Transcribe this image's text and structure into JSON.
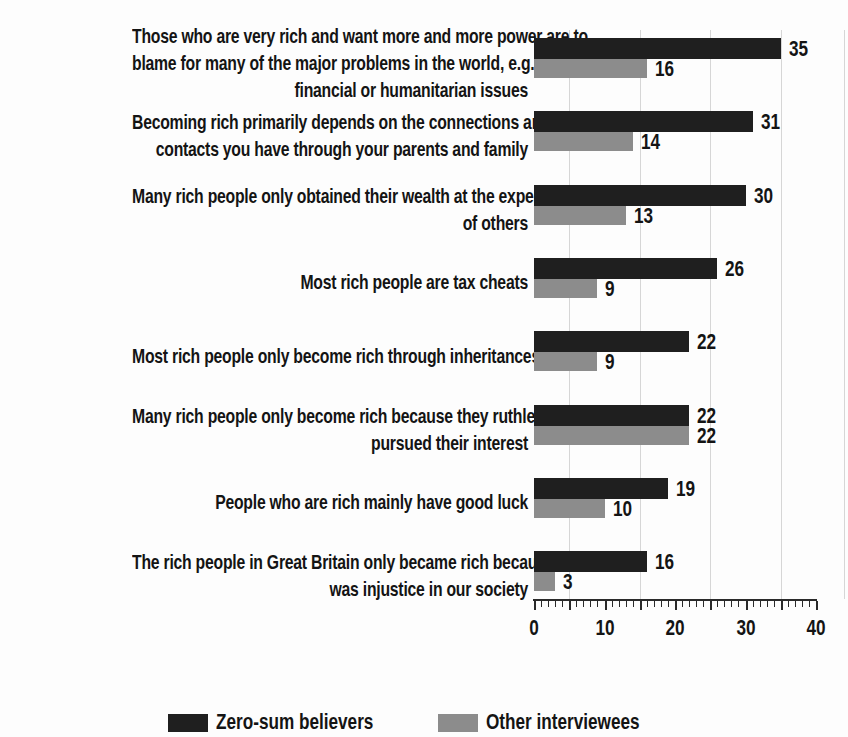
{
  "chart_data": {
    "type": "bar",
    "orientation": "horizontal",
    "title": "",
    "xlabel": "",
    "ylabel": "",
    "xlim": [
      0,
      40
    ],
    "x_tick_labels": [
      "0",
      "10",
      "20",
      "30",
      "40"
    ],
    "minor_tick_step": 1,
    "major_tick_step": 5,
    "gridlines_at_units": [
      5,
      15,
      25,
      35,
      44
    ],
    "grid_color": "#d6d6d6",
    "axis_color": "#2a2a2a",
    "text_color": "#141414",
    "legend_position": "bottom",
    "categories": [
      {
        "label": "Those who are very rich and want more and more power are to blame for many of the major problems in the world, e.g., financial or humanitarian issues",
        "label_lines": [
          "Those who are very rich and want more and more power are to",
          "blame for many of the major problems in the world, e.g.,",
          "financial or humanitarian issues"
        ]
      },
      {
        "label": "Becoming rich primarily depends on the connections and contacts you have through your parents and family",
        "label_lines": [
          "Becoming rich primarily depends on the connections and",
          "contacts you have through your parents and family"
        ]
      },
      {
        "label": "Many rich people only obtained their wealth at the expense of others",
        "label_lines": [
          "Many rich people only obtained their wealth at the expense",
          "of others"
        ]
      },
      {
        "label": "Most rich people are tax cheats",
        "label_lines": [
          "Most rich people are tax cheats"
        ]
      },
      {
        "label": "Most rich people only become rich through inheritances",
        "label_lines": [
          "Most rich people only become rich through inheritances"
        ]
      },
      {
        "label": "Many rich people only become rich because they ruthlessly pursued their interest",
        "label_lines": [
          "Many rich people only become rich because they ruthlessly",
          "pursued their interest"
        ]
      },
      {
        "label": "People who are rich mainly have good luck",
        "label_lines": [
          "People who are rich mainly have good luck"
        ]
      },
      {
        "label": "The rich people in Great Britain only became rich because there was injustice in our society",
        "label_lines": [
          "The rich people in Great Britain only became rich because there",
          "was injustice in our society"
        ]
      }
    ],
    "series": [
      {
        "name": "Zero-sum believers",
        "color": "#1f1f1f",
        "values": [
          35,
          31,
          30,
          26,
          22,
          22,
          19,
          16
        ]
      },
      {
        "name": "Other interviewees",
        "color": "#8c8c8c",
        "values": [
          16,
          14,
          13,
          9,
          9,
          22,
          10,
          3
        ]
      }
    ]
  }
}
